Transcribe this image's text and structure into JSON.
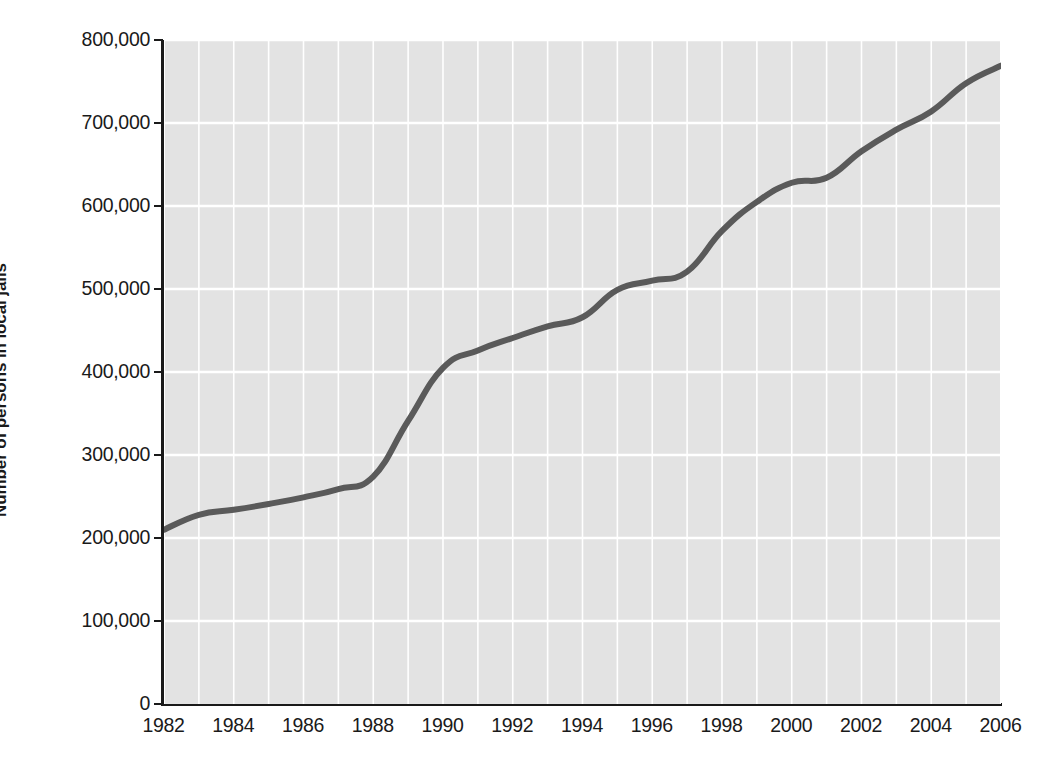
{
  "chart_data": {
    "type": "line",
    "title": "",
    "xlabel": "",
    "ylabel": "Number of persons in local jails",
    "xlim": [
      1982,
      2006
    ],
    "ylim": [
      0,
      800000
    ],
    "grid": true,
    "legend": "none",
    "y_ticks": [
      {
        "value": 800000,
        "label": "800,000"
      },
      {
        "value": 700000,
        "label": "700,000"
      },
      {
        "value": 600000,
        "label": "600,000"
      },
      {
        "value": 500000,
        "label": "500,000"
      },
      {
        "value": 400000,
        "label": "400,000"
      },
      {
        "value": 300000,
        "label": "300,000"
      },
      {
        "value": 200000,
        "label": "200,000"
      },
      {
        "value": 100000,
        "label": "100,000"
      },
      {
        "value": 0,
        "label": "0"
      }
    ],
    "x_ticks": [
      {
        "value": 1982,
        "label": "1982"
      },
      {
        "value": 1984,
        "label": "1984"
      },
      {
        "value": 1986,
        "label": "1986"
      },
      {
        "value": 1988,
        "label": "1988"
      },
      {
        "value": 1990,
        "label": "1990"
      },
      {
        "value": 1992,
        "label": "1992"
      },
      {
        "value": 1994,
        "label": "1994"
      },
      {
        "value": 1996,
        "label": "1996"
      },
      {
        "value": 1998,
        "label": "1998"
      },
      {
        "value": 2000,
        "label": "2000"
      },
      {
        "value": 2002,
        "label": "2002"
      },
      {
        "value": 2004,
        "label": "2004"
      },
      {
        "value": 2006,
        "label": "2006"
      }
    ],
    "x": [
      1982,
      1983,
      1984,
      1985,
      1986,
      1987,
      1988,
      1989,
      1990,
      1991,
      1992,
      1993,
      1994,
      1995,
      1996,
      1997,
      1998,
      1999,
      2000,
      2001,
      2002,
      2003,
      2004,
      2005,
      2006
    ],
    "values": [
      210000,
      228000,
      234000,
      241000,
      249000,
      259000,
      274000,
      341000,
      405000,
      426000,
      441000,
      455000,
      466000,
      499000,
      510000,
      521000,
      570000,
      605000,
      628000,
      634000,
      666000,
      692000,
      714000,
      748000,
      769000
    ],
    "series": [
      {
        "name": "Number of persons in local jails",
        "color": "#5a5a5a",
        "values": [
          210000,
          228000,
          234000,
          241000,
          249000,
          259000,
          274000,
          341000,
          405000,
          426000,
          441000,
          455000,
          466000,
          499000,
          510000,
          521000,
          570000,
          605000,
          628000,
          634000,
          666000,
          692000,
          714000,
          748000,
          769000
        ]
      }
    ],
    "style": {
      "plot_background": "#e3e3e3",
      "gridline_color": "#ffffff",
      "axis_color": "#1a1a1a",
      "line_color": "#5a5a5a",
      "line_width": 6,
      "page_background": "#ffffff"
    }
  }
}
